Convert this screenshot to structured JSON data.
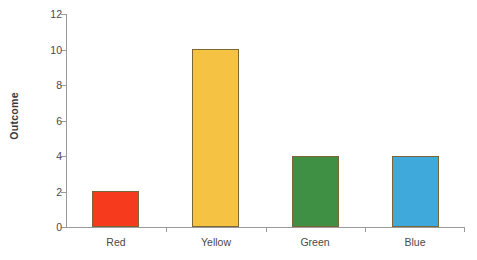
{
  "chart_data": {
    "type": "bar",
    "title": "",
    "xlabel": "",
    "ylabel": "Outcome",
    "categories": [
      "Red",
      "Yellow",
      "Green",
      "Blue"
    ],
    "values": [
      2,
      10,
      4,
      4
    ],
    "series": [
      {
        "name": "Outcome",
        "values": [
          2,
          10,
          4,
          4
        ]
      }
    ],
    "colors": [
      "#f53a1e",
      "#f6c243",
      "#3f8f45",
      "#3fa9dc"
    ],
    "bar_edge_color": "#7a6636",
    "ylim": [
      0,
      12
    ],
    "yticks": [
      0,
      2,
      4,
      6,
      8,
      10,
      12
    ],
    "ytick_labels": [
      "0",
      "2",
      "4",
      "6",
      "8",
      "10",
      "12"
    ],
    "grid": false,
    "legend": "none",
    "axis_color": "#9a9a9a",
    "background": "#ffffff"
  }
}
